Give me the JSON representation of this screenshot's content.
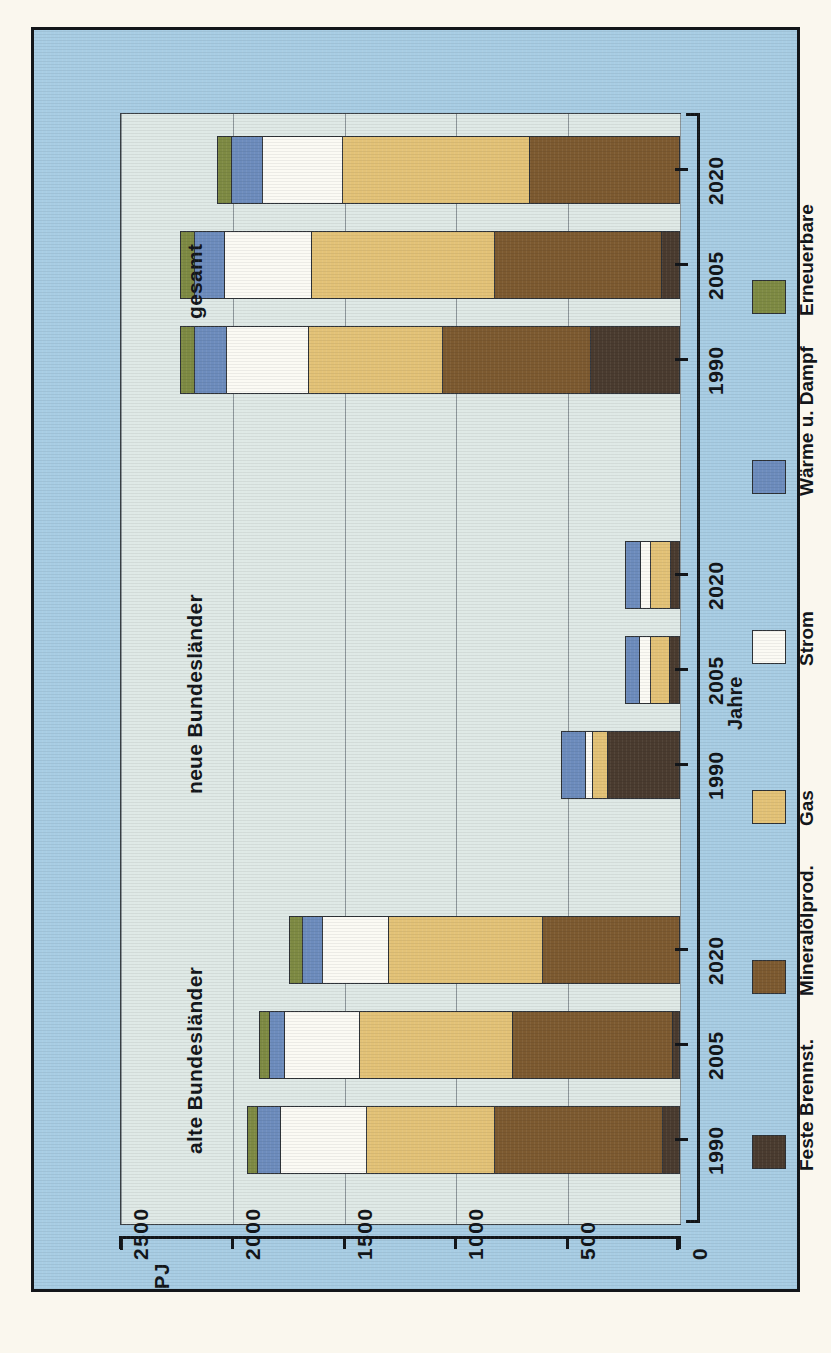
{
  "chart_data": {
    "type": "bar",
    "orientation": "horizontal-rotated",
    "title": "",
    "xlabel": "Jahre",
    "ylabel": "PJ",
    "ylim": [
      0,
      2500
    ],
    "yticks": [
      "2500",
      "2000",
      "1500",
      "1000",
      "500",
      "0"
    ],
    "grid": true,
    "legend_position": "right",
    "stacked": true,
    "groups": [
      "alte Bundesländer",
      "neue Bundesländer",
      "gesamt"
    ],
    "categories": [
      "1990",
      "2005",
      "2020"
    ],
    "series": [
      {
        "name": "Feste Brennst.",
        "color": "#4a3b2f",
        "values": {
          "alte Bundesländer": [
            70,
            25,
            0
          ],
          "neue Bundesländer": [
            325,
            40,
            35
          ],
          "gesamt": [
            395,
            75,
            0
          ]
        }
      },
      {
        "name": "Mineralölprod.",
        "color": "#7d5a30",
        "values": {
          "alte Bundesländer": [
            755,
            720,
            610
          ],
          "neue Bundesländer": [
            0,
            0,
            0
          ],
          "gesamt": [
            665,
            750,
            670
          ]
        }
      },
      {
        "name": "Gas",
        "color": "#e3c277",
        "values": {
          "alte Bundesländer": [
            575,
            690,
            695
          ],
          "neue Bundesländer": [
            65,
            90,
            95
          ],
          "gesamt": [
            600,
            825,
            840
          ]
        }
      },
      {
        "name": "Strom",
        "color": "#fbfaf4",
        "values": {
          "alte Bundesländer": [
            390,
            335,
            295
          ],
          "neue Bundesländer": [
            35,
            50,
            45
          ],
          "gesamt": [
            370,
            390,
            360
          ]
        }
      },
      {
        "name": "Wärme u. Dampf",
        "color": "#6d8cbd",
        "values": {
          "alte Bundesländer": [
            100,
            70,
            90
          ],
          "neue Bundesländer": [
            105,
            65,
            70
          ],
          "gesamt": [
            145,
            135,
            140
          ]
        }
      },
      {
        "name": "Erneuerbare",
        "color": "#7e8a43",
        "values": {
          "alte Bundesländer": [
            45,
            45,
            60
          ],
          "neue Bundesländer": [
            0,
            0,
            0
          ],
          "gesamt": [
            60,
            60,
            60
          ]
        }
      }
    ],
    "bar_totals": {
      "alte Bundesländer": [
        1935,
        1885,
        1750
      ],
      "neue Bundesländer": [
        530,
        245,
        245
      ],
      "gesamt": [
        2235,
        2235,
        2070
      ]
    }
  },
  "axes": {
    "value_axis_label": "PJ",
    "value_ticks": [
      "2500",
      "2000",
      "1500",
      "1000",
      "500",
      "0"
    ],
    "category_axis_label": "Jahre",
    "category_ticks": [
      "1990",
      "2005",
      "2020"
    ]
  },
  "group_labels": {
    "g1": "alte Bundesländer",
    "g2": "neue Bundesländer",
    "g3": "gesamt"
  },
  "legend": {
    "items": [
      {
        "label": "Feste Brennst.",
        "color": "#4a3b2f",
        "icon": "legend-swatch"
      },
      {
        "label": "Mineralölprod.",
        "color": "#7d5a30",
        "icon": "legend-swatch"
      },
      {
        "label": "Gas",
        "color": "#e3c277",
        "icon": "legend-swatch"
      },
      {
        "label": "Strom",
        "color": "#fbfaf4",
        "icon": "legend-swatch"
      },
      {
        "label": "Wärme u. Dampf",
        "color": "#6d8cbd",
        "icon": "legend-swatch"
      },
      {
        "label": "Erneuerbare",
        "color": "#7e8a43",
        "icon": "legend-swatch"
      }
    ]
  },
  "colors": {
    "plate_background": "#a8cde4",
    "panel_background": "#dfe9e6",
    "ink": "#13161a",
    "gridline": "#8e979b",
    "paper": "#faf7ee"
  }
}
